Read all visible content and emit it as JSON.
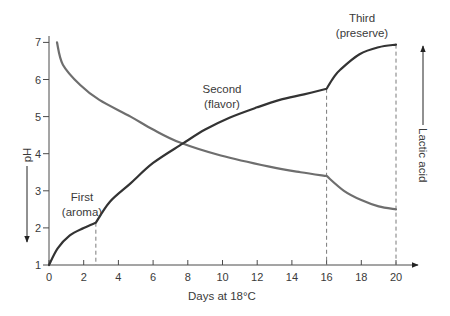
{
  "chart_data": {
    "type": "line",
    "title": "",
    "xlabel": "Days at 18°C",
    "ylabel": "pH",
    "secondary_label": "Lactic acid",
    "xlim": [
      0,
      20
    ],
    "ylim": [
      1,
      7
    ],
    "x_ticks": [
      0,
      2,
      4,
      6,
      8,
      10,
      12,
      14,
      16,
      18,
      20
    ],
    "y_ticks": [
      1,
      2,
      3,
      4,
      5,
      6,
      7
    ],
    "grid": false,
    "phase_boundaries": [
      2.7,
      16,
      20
    ],
    "annotations": [
      {
        "text": [
          "First",
          "(aroma)"
        ],
        "x": 1.9,
        "y": 2.8
      },
      {
        "text": [
          "Second",
          "(flavor)"
        ],
        "x": 10.0,
        "y": 4.9
      },
      {
        "text": [
          "Third",
          "(preserve)"
        ],
        "x": 18.0,
        "y": 6.65
      }
    ],
    "series": [
      {
        "name": "Lactic acid",
        "color": "#333333",
        "points": [
          [
            0,
            1.0
          ],
          [
            0.5,
            1.45
          ],
          [
            1.2,
            1.8
          ],
          [
            2.0,
            2.0
          ],
          [
            2.7,
            2.14
          ],
          [
            3.5,
            2.7
          ],
          [
            4.7,
            3.2
          ],
          [
            6.0,
            3.75
          ],
          [
            7.7,
            4.27
          ],
          [
            9.0,
            4.65
          ],
          [
            10.4,
            4.97
          ],
          [
            12.0,
            5.25
          ],
          [
            13.3,
            5.45
          ],
          [
            14.7,
            5.6
          ],
          [
            16.0,
            5.75
          ],
          [
            16.4,
            6.05
          ],
          [
            16.8,
            6.27
          ],
          [
            17.9,
            6.68
          ],
          [
            19.0,
            6.87
          ],
          [
            20.0,
            6.94
          ]
        ]
      },
      {
        "name": "pH",
        "color": "#6e6e6e",
        "points": [
          [
            0.46,
            7.0
          ],
          [
            0.8,
            6.4
          ],
          [
            1.8,
            5.85
          ],
          [
            2.9,
            5.45
          ],
          [
            4.7,
            5.0
          ],
          [
            6.0,
            4.65
          ],
          [
            7.55,
            4.3
          ],
          [
            9.9,
            3.95
          ],
          [
            12.7,
            3.65
          ],
          [
            14.5,
            3.5
          ],
          [
            16.0,
            3.4
          ],
          [
            17.0,
            3.0
          ],
          [
            18.0,
            2.75
          ],
          [
            19.0,
            2.58
          ],
          [
            20.0,
            2.5
          ]
        ]
      }
    ]
  },
  "axes": {
    "x_title": "Days at 18°C",
    "y_title": "pH",
    "secondary_title": "Lactic acid"
  },
  "labels": {
    "first_line1": "First",
    "first_line2": "(aroma)",
    "second_line1": "Second",
    "second_line2": "(flavor)",
    "third_line1": "Third",
    "third_line2": "(preserve)"
  }
}
